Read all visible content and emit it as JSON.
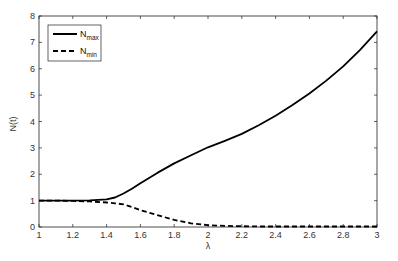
{
  "chart_data": {
    "type": "line",
    "title": "",
    "xlabel": "λ",
    "ylabel": "N(t)",
    "xlim": [
      1,
      3
    ],
    "ylim": [
      0,
      8
    ],
    "xticks": [
      1,
      1.2,
      1.4,
      1.6,
      1.8,
      2,
      2.2,
      2.4,
      2.6,
      2.8,
      3
    ],
    "xtick_labels": [
      "1",
      "1.2",
      "1.4",
      "1.6",
      "1.8",
      "2",
      "2.2",
      "2.4",
      "2.6",
      "2.8",
      "3"
    ],
    "yticks": [
      0,
      1,
      2,
      3,
      4,
      5,
      6,
      7,
      8
    ],
    "ytick_labels": [
      "0",
      "1",
      "2",
      "3",
      "4",
      "5",
      "6",
      "7",
      "8"
    ],
    "grid": false,
    "legend_position": "upper left",
    "x": [
      1.0,
      1.1,
      1.2,
      1.3,
      1.4,
      1.45,
      1.5,
      1.55,
      1.6,
      1.7,
      1.8,
      1.9,
      2.0,
      2.1,
      2.2,
      2.3,
      2.4,
      2.5,
      2.6,
      2.7,
      2.8,
      2.9,
      3.0
    ],
    "series": [
      {
        "name": "N_max",
        "legend_label": "N",
        "legend_sub": "max",
        "style": "solid",
        "color": "#000000",
        "values": [
          1.0,
          1.0,
          1.0,
          1.01,
          1.05,
          1.12,
          1.27,
          1.45,
          1.66,
          2.05,
          2.41,
          2.72,
          3.02,
          3.27,
          3.53,
          3.86,
          4.22,
          4.62,
          5.06,
          5.55,
          6.09,
          6.72,
          7.42
        ]
      },
      {
        "name": "N_min",
        "legend_label": "N",
        "legend_sub": "min",
        "style": "dashed",
        "color": "#000000",
        "values": [
          1.0,
          1.0,
          0.99,
          0.97,
          0.93,
          0.9,
          0.86,
          0.76,
          0.64,
          0.45,
          0.27,
          0.14,
          0.07,
          0.04,
          0.03,
          0.02,
          0.02,
          0.02,
          0.02,
          0.02,
          0.02,
          0.02,
          0.02
        ]
      }
    ]
  }
}
